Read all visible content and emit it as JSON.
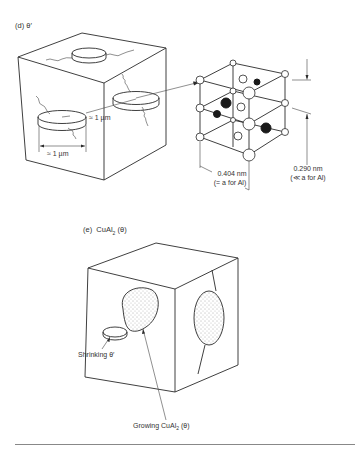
{
  "figure": {
    "panel_d": {
      "label": "(d) θ′",
      "precipitate_thickness": "≈ 1 µm",
      "precipitate_diameter": "≈ 1 µm",
      "lattice_a": "0.404 nm",
      "lattice_a_note": "(= a for Al)",
      "lattice_c": "0.290 nm",
      "lattice_c_note": "(≪ a for Al)"
    },
    "panel_e": {
      "label_prefix": "(e)",
      "label_formula": "CuAl",
      "label_sub": "2",
      "label_suffix": " (θ)",
      "callout_shrinking": "Shrinking θ′",
      "callout_growing_prefix": "Growing CuAl",
      "callout_growing_sub": "2",
      "callout_growing_suffix": " (θ)"
    },
    "colors": {
      "ink": "#2a2a2a",
      "paper": "#ffffff",
      "rule": "#888888"
    }
  }
}
